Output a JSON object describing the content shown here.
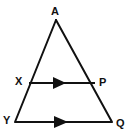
{
  "figure": {
    "name": "triangle-with-parallel-segments",
    "background_color": "#ffffff",
    "stroke_color": "#111111",
    "stroke_width": 2,
    "width": 130,
    "height": 135
  },
  "labels": {
    "apex": "A",
    "left_mid": "X",
    "right_mid": "P",
    "bottom_left": "Y",
    "bottom_right": "Q"
  },
  "geometry": {
    "points": {
      "A": {
        "x": 56,
        "y": 20
      },
      "X": {
        "x": 29,
        "y": 83
      },
      "P": {
        "x": 95,
        "y": 83
      },
      "Y": {
        "x": 15,
        "y": 122
      },
      "Q": {
        "x": 112,
        "y": 122
      }
    },
    "segments": [
      {
        "name": "side-AY",
        "from": "A",
        "to": "Y",
        "arrow": false
      },
      {
        "name": "side-AQ",
        "from": "A",
        "to": "Q",
        "arrow": false
      },
      {
        "name": "segment-XP",
        "from": "X",
        "to": "P",
        "arrow": true
      },
      {
        "name": "segment-YQ",
        "from": "Y",
        "to": "Q",
        "arrow": true
      }
    ],
    "arrow_markers": [
      {
        "name": "arrow-on-XP",
        "x": 59,
        "y": 83,
        "direction": "right"
      },
      {
        "name": "arrow-on-YQ",
        "x": 60,
        "y": 122,
        "direction": "right"
      }
    ]
  }
}
